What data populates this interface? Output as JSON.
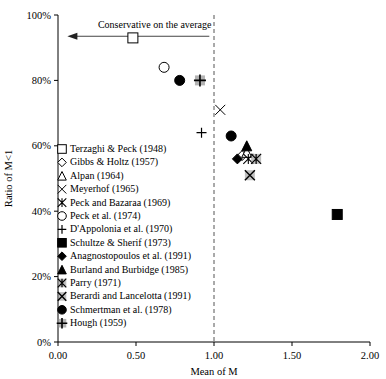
{
  "chart_data": {
    "type": "scatter",
    "title": "",
    "xlabel": "Mean of M",
    "ylabel": "Ratio of M<1",
    "xlim": [
      0.0,
      2.0
    ],
    "ylim": [
      0,
      100
    ],
    "xticks": [
      "0.00",
      "0.50",
      "1.00",
      "1.50",
      "2.00"
    ],
    "xtick_values": [
      0.0,
      0.5,
      1.0,
      1.5,
      2.0
    ],
    "yticks": [
      "0%",
      "20%",
      "40%",
      "60%",
      "80%",
      "100%"
    ],
    "ytick_values": [
      0,
      20,
      40,
      60,
      80,
      100
    ],
    "grid": false,
    "legend_position": "inside-left",
    "reference_line": {
      "orientation": "vertical",
      "x": 1.0,
      "style": "dashed"
    },
    "annotations": [
      {
        "text": "Conservative on the average",
        "x": 0.62,
        "y": 97,
        "arrow_from_x": 0.97,
        "arrow_to_x": 0.06,
        "arrow_y": 93.5
      }
    ],
    "series": [
      {
        "name": "Terzaghi & Peck (1948)",
        "marker": "open-square",
        "x": 0.48,
        "y": 93
      },
      {
        "name": "Gibbs & Holtz (1957)",
        "marker": "open-diamond",
        "x": 1.18,
        "y": 57
      },
      {
        "name": "Alpan (1964)",
        "marker": "open-triangle",
        "x": 1.21,
        "y": 58
      },
      {
        "name": "Meyerhof (1965)",
        "marker": "x-thin",
        "x": 1.04,
        "y": 71
      },
      {
        "name": "Peck and Bazaraa (1969)",
        "marker": "x-star",
        "x": 1.22,
        "y": 56
      },
      {
        "name": "Peck et al. (1974)",
        "marker": "open-circle",
        "x": 0.68,
        "y": 84
      },
      {
        "name": "D'Appolonia et al. (1970)",
        "marker": "plus",
        "x": 0.92,
        "y": 64
      },
      {
        "name": "Schultze & Sherif (1973)",
        "marker": "filled-square",
        "x": 1.79,
        "y": 39
      },
      {
        "name": "Anagnostopoulos et al. (1991)",
        "marker": "filled-diamond",
        "x": 1.15,
        "y": 56
      },
      {
        "name": "Burland and Burbidge (1985)",
        "marker": "filled-triangle",
        "x": 1.21,
        "y": 60
      },
      {
        "name": "Parry (1971)",
        "marker": "x-star-shaded",
        "x": 1.27,
        "y": 56
      },
      {
        "name": "Berardi and Lancelotta (1991)",
        "marker": "x-square-shaded",
        "x": 1.23,
        "y": 51
      },
      {
        "name": "Schmertman et al. (1978)",
        "marker": "filled-circle-a",
        "x": 1.11,
        "y": 63
      },
      {
        "name": "Schmertman et al. (1978) b",
        "marker": "filled-circle-b",
        "x": 0.78,
        "y": 80
      },
      {
        "name": "Hough (1959)",
        "marker": "plus-shaded",
        "x": 0.91,
        "y": 80
      }
    ],
    "legend_entries": [
      {
        "label": "Terzaghi & Peck (1948)",
        "marker": "open-square"
      },
      {
        "label": "Gibbs & Holtz (1957)",
        "marker": "open-diamond"
      },
      {
        "label": "Alpan (1964)",
        "marker": "open-triangle"
      },
      {
        "label": "Meyerhof (1965)",
        "marker": "x-thin"
      },
      {
        "label": "Peck and Bazaraa (1969)",
        "marker": "x-star"
      },
      {
        "label": "Peck et al. (1974)",
        "marker": "open-circle"
      },
      {
        "label": "D'Appolonia et al. (1970)",
        "marker": "plus"
      },
      {
        "label": "Schultze & Sherif (1973)",
        "marker": "filled-square"
      },
      {
        "label": "Anagnostopoulos et al. (1991)",
        "marker": "filled-diamond"
      },
      {
        "label": "Burland and Burbidge (1985)",
        "marker": "filled-triangle"
      },
      {
        "label": "Parry (1971)",
        "marker": "x-star-shaded"
      },
      {
        "label": "Berardi and Lancelotta (1991)",
        "marker": "x-square-shaded"
      },
      {
        "label": "Schmertman et al. (1978)",
        "marker": "filled-circle-a"
      },
      {
        "label": "Hough (1959)",
        "marker": "plus-shaded"
      }
    ]
  },
  "colors": {
    "axis": "#000000",
    "marker_fill": "#000000",
    "marker_open": "#ffffff",
    "shaded": "#8a8a8a",
    "dashed_line": "#555555"
  }
}
